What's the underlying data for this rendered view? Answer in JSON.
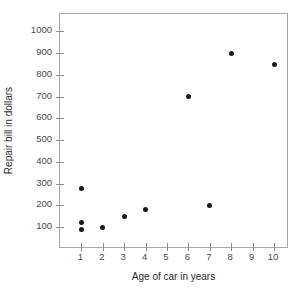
{
  "chart_data": {
    "type": "scatter",
    "title": "",
    "xlabel": "Age of car in years",
    "ylabel": "Repair bill in dollars",
    "xlim": [
      0,
      10.7
    ],
    "ylim": [
      0,
      1080
    ],
    "grid": false,
    "legend": null,
    "marker": {
      "shape": "circle",
      "filled": true,
      "color": "#1a1a1a",
      "size_px": 5
    },
    "xticks": [
      1,
      2,
      3,
      4,
      5,
      6,
      7,
      8,
      9,
      10
    ],
    "xticklabels": [
      "1",
      "2",
      "3",
      "4",
      "5",
      "6",
      "7",
      "8",
      "9",
      "10"
    ],
    "yticks": [
      100,
      200,
      300,
      400,
      500,
      600,
      700,
      800,
      900,
      1000
    ],
    "yticklabels": [
      "100",
      "200",
      "300",
      "400",
      "500",
      "600",
      "700",
      "800",
      "900",
      "1000"
    ],
    "points": [
      {
        "x": 1,
        "y": 280
      },
      {
        "x": 1,
        "y": 120
      },
      {
        "x": 1,
        "y": 90
      },
      {
        "x": 2,
        "y": 100
      },
      {
        "x": 3,
        "y": 150
      },
      {
        "x": 4,
        "y": 180
      },
      {
        "x": 6,
        "y": 700
      },
      {
        "x": 7,
        "y": 200
      },
      {
        "x": 8,
        "y": 900
      },
      {
        "x": 10,
        "y": 850
      }
    ]
  },
  "colors": {
    "marker": "#1a1a1a",
    "axis": "#a9a9a9",
    "tick": "#8c8c8c",
    "tick_label": "#4a4a4a",
    "axis_title": "#2b2b2b",
    "background": "#ffffff"
  }
}
